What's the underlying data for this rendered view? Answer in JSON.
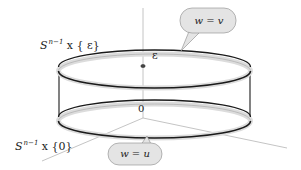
{
  "diagram": {
    "labels": {
      "top_set_base": "S",
      "top_set_exp": "n−1",
      "top_set_rest": " x { ε}",
      "bottom_set_base": "S",
      "bottom_set_exp": "n−1",
      "bottom_set_rest": " x {0}",
      "epsilon": "ε",
      "origin": "0"
    },
    "callouts": {
      "top": "w = v",
      "bottom": "w = u"
    },
    "colors": {
      "stroke": "#1a1a1a",
      "band_fill": "#dcdcdc",
      "axis": "#b0b0b0",
      "callout_fill": "#e4e4e4"
    }
  }
}
